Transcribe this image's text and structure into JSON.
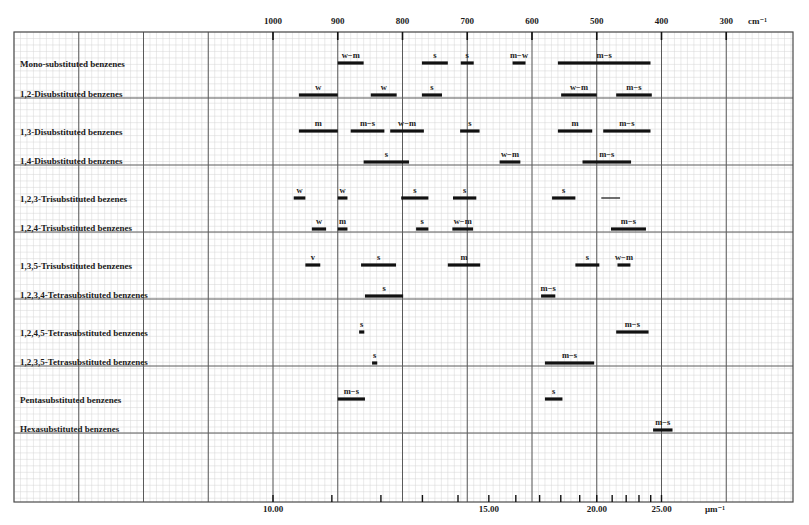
{
  "chart_data": {
    "type": "table",
    "title": "",
    "subtitle": "",
    "top_axis": {
      "label": "cm⁻¹",
      "unit": "cm-1",
      "range": [
        1000,
        300
      ],
      "ticks": [
        1000,
        900,
        800,
        700,
        600,
        500,
        400,
        300
      ],
      "tick_labels": [
        "1000",
        "900",
        "800",
        "700",
        "600",
        "500",
        "400",
        "300"
      ]
    },
    "bottom_axis": {
      "label": "μm⁻¹",
      "labeled_ticks": [
        "10.00",
        "15.00",
        "20.00",
        "25.00"
      ],
      "ticks_um": [
        10,
        11,
        12,
        13,
        14,
        15,
        16,
        17,
        18,
        19,
        20,
        21,
        22,
        23,
        24,
        25
      ]
    },
    "grid": true,
    "legend": null,
    "intensity_codes": [
      "s",
      "m",
      "w",
      "v",
      "w−m",
      "m−s",
      "m−w"
    ],
    "rows": [
      {
        "label": "Mono-substituted benzenes",
        "bands": [
          {
            "from": 900,
            "to": 860,
            "intensity": "w−m"
          },
          {
            "from": 770,
            "to": 730,
            "intensity": "s"
          },
          {
            "from": 710,
            "to": 690,
            "intensity": "s"
          },
          {
            "from": 630,
            "to": 610,
            "intensity": "m−w"
          },
          {
            "from": 560,
            "to": 417,
            "intensity": "m−s"
          }
        ]
      },
      {
        "label": "1,2-Disubstituted benzenes",
        "bands": [
          {
            "from": 960,
            "to": 900,
            "intensity": "w"
          },
          {
            "from": 849,
            "to": 809,
            "intensity": "w"
          },
          {
            "from": 770,
            "to": 739,
            "intensity": "s"
          },
          {
            "from": 555,
            "to": 500,
            "intensity": "w−m"
          },
          {
            "from": 470,
            "to": 415,
            "intensity": "m−s"
          }
        ]
      },
      {
        "label": "1,3-Disubstituted benzenes",
        "bands": [
          {
            "from": 960,
            "to": 900,
            "intensity": "m"
          },
          {
            "from": 880,
            "to": 828,
            "intensity": "m−s"
          },
          {
            "from": 819,
            "to": 767,
            "intensity": "w−m"
          },
          {
            "from": 711,
            "to": 681,
            "intensity": "s"
          },
          {
            "from": 560,
            "to": 507,
            "intensity": "m"
          },
          {
            "from": 490,
            "to": 417,
            "intensity": "m−s"
          }
        ]
      },
      {
        "label": "1,4-Disubstituted benzenes",
        "bands": [
          {
            "from": 860,
            "to": 790,
            "intensity": "s"
          },
          {
            "from": 650,
            "to": 618,
            "intensity": "w−m"
          },
          {
            "from": 522,
            "to": 447,
            "intensity": "m−s"
          }
        ]
      },
      {
        "label": "1,2,3-Trisubstituted bezenes",
        "bands": [
          {
            "from": 968,
            "to": 950,
            "intensity": "w"
          },
          {
            "from": 900,
            "to": 885,
            "intensity": "w"
          },
          {
            "from": 802,
            "to": 760,
            "intensity": "s"
          },
          {
            "from": 722,
            "to": 686,
            "intensity": "s"
          },
          {
            "from": 569,
            "to": 533,
            "intensity": "s"
          },
          {
            "from": 493,
            "to": 464,
            "intensity": "",
            "thin": true
          }
        ]
      },
      {
        "label": "1,2,4-Trisubstituted benzenes",
        "bands": [
          {
            "from": 940,
            "to": 918,
            "intensity": "w"
          },
          {
            "from": 900,
            "to": 885,
            "intensity": "m"
          },
          {
            "from": 779,
            "to": 760,
            "intensity": "s"
          },
          {
            "from": 723,
            "to": 691,
            "intensity": "w−m"
          },
          {
            "from": 478,
            "to": 424,
            "intensity": "m−s"
          }
        ]
      },
      {
        "label": "1,3,5-Trisubstituted benzenes",
        "bands": [
          {
            "from": 950,
            "to": 927,
            "intensity": "v"
          },
          {
            "from": 864,
            "to": 810,
            "intensity": "s"
          },
          {
            "from": 730,
            "to": 680,
            "intensity": "m"
          },
          {
            "from": 533,
            "to": 496,
            "intensity": "s"
          },
          {
            "from": 468,
            "to": 448,
            "intensity": "w−m"
          }
        ]
      },
      {
        "label": "1,2,3,4-Tetrasubstituted benzenes",
        "bands": [
          {
            "from": 858,
            "to": 799,
            "intensity": "s"
          },
          {
            "from": 586,
            "to": 564,
            "intensity": "m−s"
          }
        ]
      },
      {
        "label": "1,2,4,5-Tetrasubstituted benzenes",
        "bands": [
          {
            "from": 867,
            "to": 859,
            "intensity": "s"
          },
          {
            "from": 470,
            "to": 420,
            "intensity": "m−s"
          }
        ]
      },
      {
        "label": "1,2,3,5-Tetrasubstituted benzenes",
        "bands": [
          {
            "from": 847,
            "to": 839,
            "intensity": "s"
          },
          {
            "from": 580,
            "to": 504,
            "intensity": "m−s"
          }
        ]
      },
      {
        "label": "Pentasubstituted benzenes",
        "bands": [
          {
            "from": 900,
            "to": 858,
            "intensity": "m−s"
          },
          {
            "from": 580,
            "to": 553,
            "intensity": "s"
          }
        ]
      },
      {
        "label": "Hexasubstituted benzenes",
        "bands": [
          {
            "from": 413,
            "to": 383,
            "intensity": "m−s"
          }
        ]
      }
    ]
  },
  "labels": {
    "top_unit": "cm⁻¹",
    "bottom_unit": "μm⁻¹",
    "bottom_ticks": [
      "10.00",
      "15.00",
      "20.00",
      "25.00"
    ]
  },
  "colors": {
    "frame": "#4a4a4a",
    "major_grid": "#5a5a5a",
    "minor_grid": "#d4d4d4",
    "bar": "#111111",
    "text": "#1a1a1a"
  }
}
